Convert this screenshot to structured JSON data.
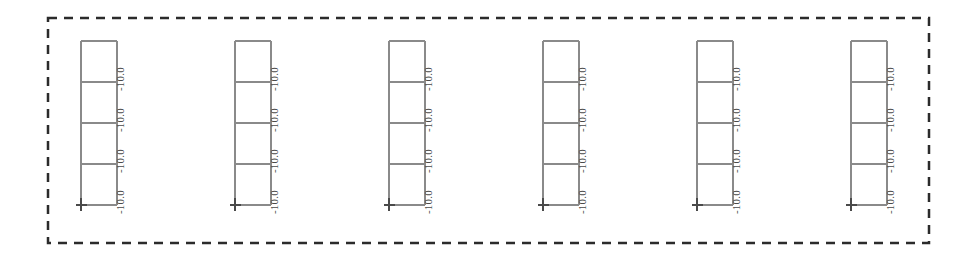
{
  "diagram": {
    "type": "structural-frame-elevation",
    "canvas": {
      "width": 975,
      "height": 260,
      "background": "#ffffff"
    },
    "selection_boundary": {
      "name": "dashed-selection-boundary",
      "x": 48,
      "y": 18,
      "width": 881,
      "height": 225,
      "stroke": "#2b2b2b",
      "stroke_width": 2.5,
      "dash": "9 7",
      "style": "dashed"
    },
    "frame_geometry": {
      "storeys": 4,
      "bays": 1,
      "bay_width": 36,
      "storey_height": 41,
      "top_y": 41,
      "base_y": 205,
      "floor_levels_y": [
        41,
        82,
        123,
        164,
        205
      ],
      "member_stroke": "#8a8a8a",
      "member_stroke_width": 1.1
    },
    "support": {
      "name": "base-support-marker",
      "type": "fixed-support",
      "glyph": "cross",
      "stroke": "#4a4a4a",
      "position": "base-left-node"
    },
    "load_label": {
      "text": "-10.0",
      "color": "#4a4a4a",
      "rotation_deg": -90,
      "per_storey": true,
      "count_per_frame": 4
    },
    "frames": [
      {
        "id": "frame-1",
        "label": "Frame 1",
        "x": 81,
        "loads": [
          "-10.0",
          "-10.0",
          "-10.0",
          "-10.0"
        ]
      },
      {
        "id": "frame-2",
        "label": "Frame 2",
        "x": 235,
        "loads": [
          "-10.0",
          "-10.0",
          "-10.0",
          "-10.0"
        ]
      },
      {
        "id": "frame-3",
        "label": "Frame 3",
        "x": 389,
        "loads": [
          "-10.0",
          "-10.0",
          "-10.0",
          "-10.0"
        ]
      },
      {
        "id": "frame-4",
        "label": "Frame 4",
        "x": 543,
        "loads": [
          "-10.0",
          "-10.0",
          "-10.0",
          "-10.0"
        ]
      },
      {
        "id": "frame-5",
        "label": "Frame 5",
        "x": 697,
        "loads": [
          "-10.0",
          "-10.0",
          "-10.0",
          "-10.0"
        ]
      },
      {
        "id": "frame-6",
        "label": "Frame 6",
        "x": 851,
        "loads": [
          "-10.0",
          "-10.0",
          "-10.0",
          "-10.0"
        ]
      }
    ]
  },
  "chart_data": {
    "type": "diagram",
    "title": "",
    "subtitle": "",
    "xlabel": "",
    "ylabel": "",
    "categories": [
      "Frame 1",
      "Frame 2",
      "Frame 3",
      "Frame 4",
      "Frame 5",
      "Frame 6"
    ],
    "series": [
      {
        "name": "Storey 4 (top) load",
        "values": [
          -10.0,
          -10.0,
          -10.0,
          -10.0,
          -10.0,
          -10.0
        ]
      },
      {
        "name": "Storey 3 load",
        "values": [
          -10.0,
          -10.0,
          -10.0,
          -10.0,
          -10.0,
          -10.0
        ]
      },
      {
        "name": "Storey 2 load",
        "values": [
          -10.0,
          -10.0,
          -10.0,
          -10.0,
          -10.0,
          -10.0
        ]
      },
      {
        "name": "Storey 1 (base) load",
        "values": [
          -10.0,
          -10.0,
          -10.0,
          -10.0,
          -10.0,
          -10.0
        ]
      }
    ],
    "annotations": [
      "-10.0",
      "-10.0",
      "-10.0",
      "-10.0",
      "-10.0",
      "-10.0",
      "-10.0",
      "-10.0",
      "-10.0",
      "-10.0",
      "-10.0",
      "-10.0",
      "-10.0",
      "-10.0",
      "-10.0",
      "-10.0",
      "-10.0",
      "-10.0",
      "-10.0",
      "-10.0",
      "-10.0",
      "-10.0",
      "-10.0",
      "-10.0"
    ],
    "legend": [],
    "grid": false
  }
}
